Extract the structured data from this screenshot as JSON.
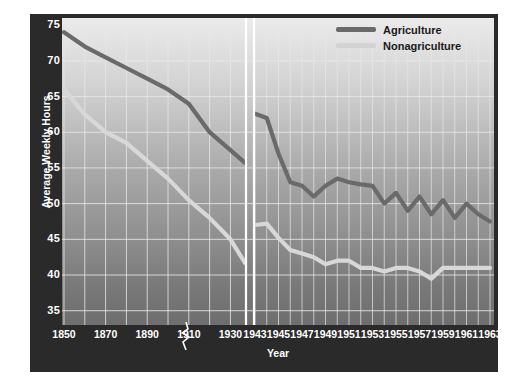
{
  "chart_data": {
    "type": "line",
    "title": "",
    "xlabel": "Year",
    "ylabel": "Average Weekly Hours",
    "ylim": [
      33,
      76
    ],
    "yticks": [
      35,
      40,
      45,
      50,
      55,
      60,
      65,
      70,
      75
    ],
    "grid": true,
    "legend_position": "top-right",
    "axis_break": true,
    "axis_break_note": "Axis broken between 1930s and 1943; left panel decadal 1850-1930, right panel annual 1943-1963",
    "panels": [
      {
        "name": "historical",
        "xticks": [
          1850,
          1870,
          1890,
          1910,
          1930
        ],
        "x": [
          1850,
          1860,
          1870,
          1880,
          1890,
          1900,
          1910,
          1920,
          1930,
          1937
        ],
        "series": [
          {
            "name": "Agriculture",
            "values": [
              74.0,
              72.0,
              70.5,
              69.0,
              67.5,
              66.0,
              64.0,
              60.0,
              57.5,
              55.7
            ]
          },
          {
            "name": "Nonagriculture",
            "values": [
              66.0,
              62.5,
              60.0,
              58.5,
              56.0,
              53.5,
              50.5,
              48.0,
              45.0,
              41.7
            ]
          }
        ]
      },
      {
        "name": "modern",
        "xticks": [
          1943,
          1945,
          1947,
          1949,
          1951,
          1953,
          1955,
          1957,
          1959,
          1961,
          1963
        ],
        "x": [
          1943,
          1944,
          1945,
          1946,
          1947,
          1948,
          1949,
          1950,
          1951,
          1952,
          1953,
          1954,
          1955,
          1956,
          1957,
          1958,
          1959,
          1960,
          1961,
          1962,
          1963
        ],
        "series": [
          {
            "name": "Agriculture",
            "values": [
              62.6,
              62.0,
              57.0,
              53.0,
              52.5,
              51.0,
              52.5,
              53.5,
              53.0,
              52.7,
              52.5,
              50.0,
              51.5,
              49.0,
              51.0,
              48.5,
              50.5,
              48.0,
              50.0,
              48.5,
              47.5
            ]
          },
          {
            "name": "Nonagriculture",
            "values": [
              47.0,
              47.2,
              45.2,
              43.5,
              43.0,
              42.5,
              41.5,
              42.0,
              42.0,
              41.0,
              41.0,
              40.5,
              41.0,
              41.0,
              40.5,
              39.5,
              41.0,
              41.0,
              41.0,
              41.0,
              41.0
            ]
          }
        ]
      }
    ],
    "colors": {
      "agriculture": "#6a6a6a",
      "nonagriculture": "#d8d8d8",
      "axis_band": "#2a2a2a",
      "grid": "#e8e8e8",
      "break_line": "#ffffff"
    }
  },
  "legend": {
    "items": [
      {
        "label": "Agriculture",
        "color": "#6a6a6a"
      },
      {
        "label": "Nonagriculture",
        "color": "#d2d2d2"
      }
    ]
  },
  "axes": {
    "y_title": "Average Weekly Hours",
    "x_title": "Year",
    "y_ticks": [
      "75",
      "70",
      "65",
      "60",
      "55",
      "50",
      "45",
      "40",
      "35"
    ],
    "x_ticks_left": [
      "1850",
      "1870",
      "1890",
      "1910",
      "1930"
    ],
    "x_ticks_right": [
      "1943",
      "1945",
      "1947",
      "1949",
      "1951",
      "1953",
      "1955",
      "1957",
      "1959",
      "1961",
      "1963"
    ]
  }
}
